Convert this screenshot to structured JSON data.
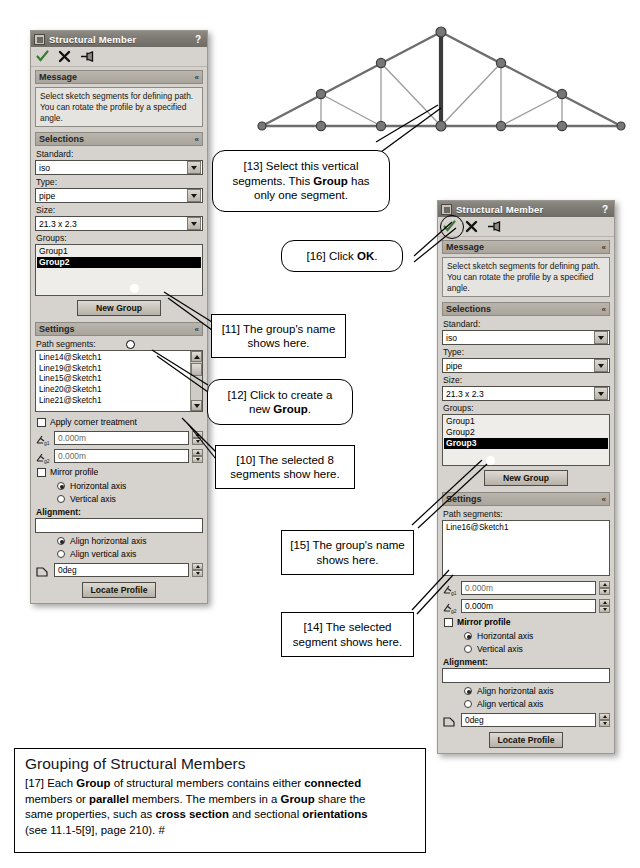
{
  "page": {
    "background": "#ffffff"
  },
  "panel1": {
    "title": "Structural Member",
    "help": "?",
    "icons": {
      "ok": "check-icon",
      "cancel": "x-icon",
      "pin": "pin-icon",
      "title": "structural-member-icon"
    },
    "sections": {
      "message": {
        "label": "Message",
        "chevron": "«",
        "text": "Select sketch segments for defining path. You can rotate the profile by a specified angle."
      },
      "selections": {
        "label": "Selections",
        "chevron": "«"
      },
      "settings": {
        "label": "Settings",
        "chevron": "«"
      }
    },
    "standard": {
      "label": "Standard:",
      "value": "iso"
    },
    "type": {
      "label": "Type:",
      "value": "pipe"
    },
    "size": {
      "label": "Size:",
      "value": "21.3 x 2.3"
    },
    "groups": {
      "label": "Groups:",
      "items": [
        "Group1",
        "Group2"
      ],
      "selected_index": 1
    },
    "new_group_button": "New Group",
    "path_segments": {
      "label": "Path segments:",
      "items": [
        "Line14@Sketch1",
        "Line19@Sketch1",
        "Line15@Sketch1",
        "Line20@Sketch1",
        "Line21@Sketch1"
      ]
    },
    "corner_treatment": {
      "label": "Apply corner treatment",
      "checked": false
    },
    "gap1": {
      "icon": "gap-between-members-icon",
      "value": "0.000m"
    },
    "gap2": {
      "icon": "gap-member-to-member-icon",
      "value": "0.000m"
    },
    "mirror_profile": {
      "label": "Mirror profile",
      "checked": false
    },
    "mirror_options": [
      {
        "label": "Horizontal axis",
        "selected": true
      },
      {
        "label": "Vertical axis",
        "selected": false
      }
    ],
    "alignment": {
      "label": "Alignment:",
      "value": ""
    },
    "align_options": [
      {
        "label": "Align horizontal axis",
        "selected": true
      },
      {
        "label": "Align vertical axis",
        "selected": false
      }
    ],
    "rotation": {
      "icon": "rotation-angle-icon",
      "value": "0deg"
    },
    "locate_profile_button": "Locate Profile"
  },
  "panel2": {
    "title": "Structural Member",
    "help": "?",
    "icons": {
      "ok": "check-icon",
      "cancel": "x-icon",
      "pin": "pin-icon",
      "title": "structural-member-icon"
    },
    "sections": {
      "message": {
        "label": "Message",
        "chevron": "«",
        "text": "Select sketch segments for defining path. You can rotate the profile by a specified angle."
      },
      "selections": {
        "label": "Selections",
        "chevron": "«"
      },
      "settings": {
        "label": "Settings",
        "chevron": "«"
      }
    },
    "standard": {
      "label": "Standard:",
      "value": "iso"
    },
    "type": {
      "label": "Type:",
      "value": "pipe"
    },
    "size": {
      "label": "Size:",
      "value": "21.3 x 2.3"
    },
    "groups": {
      "label": "Groups:",
      "items": [
        "Group1",
        "Group2",
        "Group3"
      ],
      "selected_index": 2
    },
    "new_group_button": "New Group",
    "path_segments": {
      "label": "Path segments:",
      "items": [
        "Line16@Sketch1"
      ]
    },
    "gap1": {
      "icon": "gap-between-members-icon",
      "value": "0.000m"
    },
    "gap2": {
      "icon": "gap-member-to-member-icon",
      "value": "0.000m"
    },
    "mirror_profile": {
      "label": "Mirror profile",
      "checked": false
    },
    "mirror_options": [
      {
        "label": "Horizontal axis",
        "selected": true
      },
      {
        "label": "Vertical axis",
        "selected": false
      }
    ],
    "alignment": {
      "label": "Alignment:",
      "value": ""
    },
    "align_options": [
      {
        "label": "Align horizontal axis",
        "selected": true
      },
      {
        "label": "Align vertical axis",
        "selected": false
      }
    ],
    "rotation": {
      "icon": "rotation-angle-icon",
      "value": "0deg"
    },
    "locate_profile_button": "Locate Profile"
  },
  "callouts": {
    "c13": {
      "number": "[13]",
      "line1": "Select this vertical",
      "line2a": "segments. This ",
      "bold": "Group",
      "line2b": " has",
      "line3": "only one segment."
    },
    "c16": {
      "number": "[16]",
      "pre": "Click ",
      "bold": "OK",
      "post": "."
    },
    "c11": {
      "number": "[11]",
      "line1": "The group's name",
      "line2": "shows here."
    },
    "c12": {
      "number": "[12]",
      "line1": "Click to create a",
      "line2pre": "new ",
      "bold": "Group",
      "line2post": "."
    },
    "c10": {
      "number": "[10]",
      "line1": "The selected 8",
      "line2": "segments show here."
    },
    "c15": {
      "number": "[15]",
      "line1": "The group's name",
      "line2": "shows here."
    },
    "c14": {
      "number": "[14]",
      "line1": "The selected",
      "line2": "segment shows here."
    }
  },
  "note": {
    "title": "Grouping of Structural Members",
    "number": "[17]",
    "p1a": " Each ",
    "b1": "Group",
    "p1b": " of structural members contains either ",
    "b2": "connected",
    "p2a": "members or ",
    "b3": "parallel",
    "p2b": " members. The members in a ",
    "b4": "Group",
    "p2c": " share the",
    "p3a": "same properties, such as ",
    "b5": "cross section",
    "p3b": " and sectional ",
    "b6": "orientations",
    "p4": "(see 11.1-5[9], page 210). #"
  },
  "truss": {
    "name": "roof-truss-sketch",
    "highlighted_member": "center-vertical-segment",
    "colors": {
      "member": "#6d6d6d",
      "highlight": "#3a3a3a",
      "node": "#555555",
      "web": "#9b9b9b"
    },
    "nodes": [
      {
        "x": 262,
        "y": 126
      },
      {
        "x": 321,
        "y": 126
      },
      {
        "x": 381,
        "y": 126
      },
      {
        "x": 441,
        "y": 126
      },
      {
        "x": 501,
        "y": 126
      },
      {
        "x": 562,
        "y": 126
      },
      {
        "x": 621,
        "y": 126
      },
      {
        "x": 321,
        "y": 94
      },
      {
        "x": 381,
        "y": 63
      },
      {
        "x": 441,
        "y": 32
      },
      {
        "x": 501,
        "y": 63
      },
      {
        "x": 562,
        "y": 94
      }
    ]
  }
}
